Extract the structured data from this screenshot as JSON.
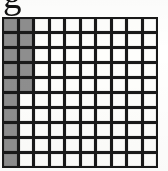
{
  "document": {
    "type": "scanned-grid-figure",
    "partial_glyph": {
      "text": "g",
      "note": "bottom of a character clipped by the top edge of the image"
    }
  },
  "colors": {
    "grid_line": "#1b1b1b",
    "cell_empty": "#fcfcfa",
    "cell_shaded": "#8e8e8e",
    "page_background": "#fdfdfc",
    "glyph": "#151515"
  },
  "chart_data": {
    "type": "heatmap",
    "title": "",
    "xlabel": "",
    "ylabel": "",
    "columns": 10,
    "rows": 10,
    "legend": [
      {
        "label": "shaded",
        "color": "#8e8e8e",
        "value": 1
      },
      {
        "label": "empty",
        "color": "#fcfcfa",
        "value": 0
      }
    ],
    "shaded_count": 15,
    "total_cells": 100,
    "values": [
      [
        1,
        1,
        0,
        0,
        0,
        0,
        0,
        0,
        0,
        0
      ],
      [
        1,
        1,
        0,
        0,
        0,
        0,
        0,
        0,
        0,
        0
      ],
      [
        1,
        1,
        0,
        0,
        0,
        0,
        0,
        0,
        0,
        0
      ],
      [
        1,
        1,
        0,
        0,
        0,
        0,
        0,
        0,
        0,
        0
      ],
      [
        1,
        1,
        0,
        0,
        0,
        0,
        0,
        0,
        0,
        0
      ],
      [
        1,
        0,
        0,
        0,
        0,
        0,
        0,
        0,
        0,
        0
      ],
      [
        1,
        0,
        0,
        0,
        0,
        0,
        0,
        0,
        0,
        0
      ],
      [
        1,
        0,
        0,
        0,
        0,
        0,
        0,
        0,
        0,
        0
      ],
      [
        1,
        0,
        0,
        0,
        0,
        0,
        0,
        0,
        0,
        0
      ],
      [
        1,
        0,
        0,
        0,
        0,
        0,
        0,
        0,
        0,
        0
      ]
    ]
  }
}
